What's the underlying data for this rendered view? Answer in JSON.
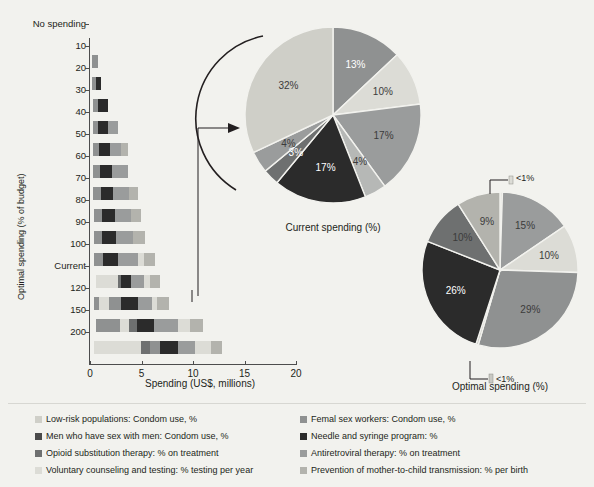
{
  "chart_data": [
    {
      "type": "bar",
      "subtype": "horizontal-stacked",
      "title": "",
      "xlabel": "Spending (US$, millions)",
      "ylabel": "Optimal spending (% of budget)",
      "xlim": [
        0,
        20
      ],
      "xticks": [
        "0",
        "5",
        "10",
        "15",
        "20"
      ],
      "grid": false,
      "categories": [
        "No spending",
        "10",
        "20",
        "30",
        "40",
        "50",
        "60",
        "70",
        "80",
        "90",
        "100",
        "Current",
        "120",
        "150",
        "200"
      ],
      "series": [
        {
          "name": "Low-risk populations: Condom use, %",
          "color": "#cfcfc8",
          "values": [
            0,
            0,
            0,
            0,
            0,
            0,
            0,
            0,
            0,
            0,
            0,
            0.85,
            0,
            0,
            0
          ]
        },
        {
          "name": "Femal sex workers: Condom use, %",
          "color": "#8f9191",
          "values": [
            0,
            0.42,
            0.46,
            0.55,
            0.6,
            0.72,
            0.78,
            0.8,
            0.84,
            0.88,
            0.92,
            0.0,
            0.95,
            0,
            0
          ]
        },
        {
          "name": "Men who have sex with men: Condom use, %",
          "color": "#4a4a4a",
          "values": [
            0,
            0,
            0,
            0,
            0,
            0,
            0,
            0,
            0,
            0,
            0,
            0,
            0,
            0,
            0
          ]
        },
        {
          "name": "Needle and syringe program: %",
          "color": "#2b2b2b",
          "values": [
            0,
            0,
            0.35,
            0.8,
            0.82,
            0.95,
            0.98,
            1.05,
            1.15,
            1.2,
            1.3,
            0.7,
            1.45,
            1.2,
            1.35
          ]
        },
        {
          "name": "Opioid substitution therapy: % on treatment",
          "color": "#6e7070",
          "values": [
            0,
            0,
            0,
            0,
            0,
            0,
            0,
            0,
            0,
            0,
            0,
            0,
            0,
            0,
            0
          ]
        },
        {
          "name": "Antiretroviral therapy: % on treatment",
          "color": "#8f9191",
          "values": [
            0,
            0,
            0,
            0,
            0,
            0,
            0,
            0,
            0,
            0,
            0,
            0,
            0,
            0,
            0
          ]
        },
        {
          "name": "Voluntary counseling and testing: % testing per year",
          "color": "#dcdcd6",
          "values": [
            0,
            0,
            0,
            0,
            0,
            0,
            0,
            0,
            0,
            0,
            0,
            0,
            0,
            0,
            0
          ]
        },
        {
          "name": "Prevention of mother-to-child transmission: % per birth",
          "color": "#b3b3ad",
          "values": [
            0,
            0,
            0,
            0,
            0,
            0,
            0,
            0,
            0,
            0,
            0,
            0,
            0,
            0,
            0
          ]
        }
      ],
      "stack_totals": [
        0,
        0.6,
        1.3,
        2.1,
        2.9,
        3.7,
        4.4,
        5.3,
        6.1,
        6.9,
        7.6,
        8.2,
        9.7,
        12.7,
        17.3
      ]
    },
    {
      "type": "pie",
      "title": "Current spending (%)",
      "labels": [
        "13%",
        "10%",
        "17%",
        "4%",
        "17%",
        "3%",
        "4%",
        "32%"
      ],
      "values": [
        13,
        10,
        17,
        4,
        17,
        3,
        4,
        32
      ],
      "slice_names": [
        "Femal sex workers: Condom use, %",
        "Voluntary counseling and testing: % testing per year",
        "Prevention of mother-to-child transmission: % per birth",
        "Antiretroviral therapy: % on treatment",
        "Needle and syringe program: %",
        "Opioid substitution therapy: % on treatment",
        "Men who have sex with men: Condom use, %",
        "Low-risk populations: Condom use, %"
      ],
      "colors": [
        "#8f9191",
        "#dcdcd6",
        "#9a9c9c",
        "#b6b8b6",
        "#2b2b2b",
        "#6e7070",
        "#9a9c9c",
        "#cfcfc8"
      ]
    },
    {
      "type": "pie",
      "title": "Optimal spending (%)",
      "labels": [
        "<1%",
        "15%",
        "10%",
        "29%",
        "<1%",
        "26%",
        "10%",
        "9%"
      ],
      "values": [
        0.5,
        15,
        10,
        29,
        0.5,
        26,
        10,
        9
      ],
      "slice_names": [
        "Low-risk populations: Condom use, %",
        "Femal sex workers: Condom use, %",
        "Voluntary counseling and testing: % testing per year",
        "Prevention of mother-to-child transmission: % per birth",
        "Men who have sex with men: Condom use, %",
        "Needle and syringe program: %",
        "Opioid substitution therapy: % on treatment",
        "Antiretroviral therapy: % on treatment"
      ],
      "colors": [
        "#dcdcd6",
        "#9a9c9c",
        "#dcdcd6",
        "#8f9191",
        "#c9c9c3",
        "#2b2b2b",
        "#6e7070",
        "#b3b3ad"
      ]
    }
  ],
  "bar_axis": {
    "y_title": "Optimal spending (% of budget)",
    "x_title": "Spending (US$, millions)",
    "y_labels": [
      "No spending",
      "10",
      "20",
      "30",
      "40",
      "50",
      "60",
      "70",
      "80",
      "90",
      "100",
      "Current",
      "120",
      "150",
      "200"
    ],
    "x_labels": [
      "0",
      "5",
      "10",
      "15",
      "20"
    ]
  },
  "pies": {
    "current": {
      "title": "Current spending (%)",
      "labels": [
        "13%",
        "10%",
        "17%",
        "4%",
        "17%",
        "3%",
        "4%",
        "32%"
      ]
    },
    "optimal": {
      "title": "Optimal spending (%)",
      "labels": [
        "<1%",
        "15%",
        "10%",
        "29%",
        "<1%",
        "26%",
        "10%",
        "9%"
      ],
      "callout_top": "<1%",
      "callout_bottom": "<1%"
    }
  },
  "legend": {
    "left": [
      {
        "label": "Low-risk populations: Condom use, %",
        "color": "#cfcfc8"
      },
      {
        "label": "Men who have sex with men: Condom use, %",
        "color": "#4a4a4a"
      },
      {
        "label": "Opioid substitution therapy: % on treatment",
        "color": "#6e7070"
      },
      {
        "label": "Voluntary counseling and testing: % testing per year",
        "color": "#dcdcd6"
      }
    ],
    "right": [
      {
        "label": "Femal sex workers: Condom use, %",
        "color": "#8f9191"
      },
      {
        "label": "Needle and syringe program: %",
        "color": "#2b2b2b"
      },
      {
        "label": "Antiretroviral therapy: % on treatment",
        "color": "#9a9c9c"
      },
      {
        "label": "Prevention of mother-to-child transmission: % per birth",
        "color": "#b3b3ad"
      }
    ]
  },
  "colors": {
    "background": "#f2f2ee",
    "axis": "#4d4d4d",
    "text": "#231f20"
  }
}
